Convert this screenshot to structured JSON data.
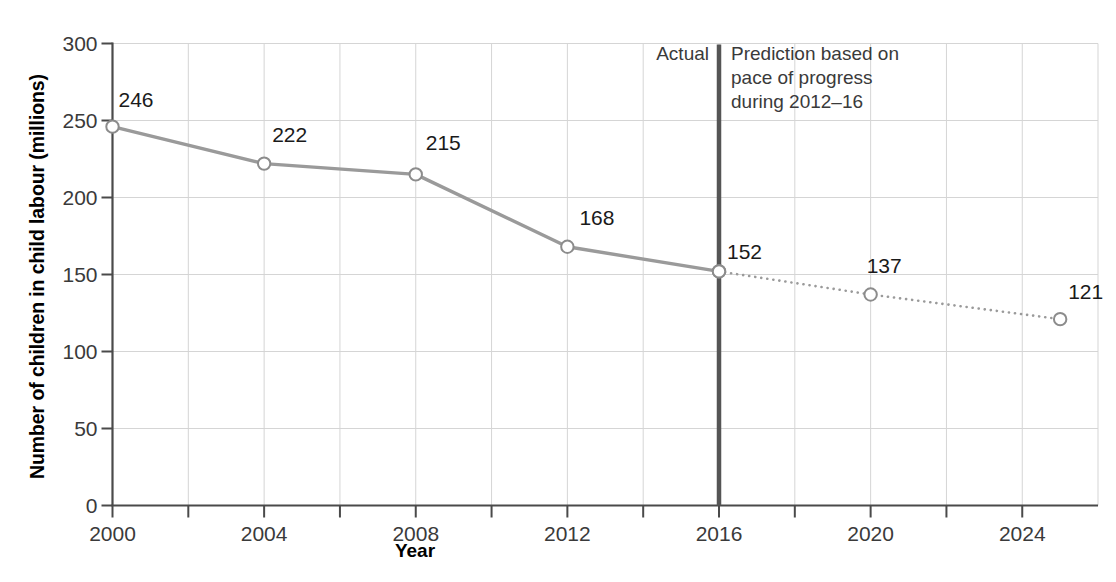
{
  "chart_data": {
    "type": "line",
    "title": "",
    "subtitle": "",
    "xlabel": "Year",
    "ylabel": "Number of children in child labour (millions)",
    "xlim": [
      1999,
      2026
    ],
    "ylim": [
      0,
      300
    ],
    "xticks": [
      2000,
      2004,
      2008,
      2012,
      2016,
      2020,
      2024
    ],
    "xtick_labels": [
      "2000",
      "2004",
      "2008",
      "2012",
      "2016",
      "2020",
      "2024"
    ],
    "xminor_step": 2,
    "yticks": [
      0,
      50,
      100,
      150,
      200,
      250,
      300
    ],
    "ytick_labels": [
      "0",
      "50",
      "100",
      "150",
      "200",
      "250",
      "300"
    ],
    "grid": true,
    "legend": "none",
    "series": [
      {
        "name": "Actual",
        "style": "solid",
        "color": "#9a9a9a",
        "x": [
          2000,
          2004,
          2008,
          2012,
          2016
        ],
        "values": [
          246,
          222,
          215,
          168,
          152
        ],
        "labels": [
          "246",
          "222",
          "215",
          "168",
          "152"
        ]
      },
      {
        "name": "Prediction based on pace of progress during 2012-16",
        "style": "dotted",
        "color": "#9a9a9a",
        "x": [
          2016,
          2020,
          2025
        ],
        "values": [
          152,
          137,
          121
        ],
        "labels": [
          "152",
          "137",
          "121"
        ]
      }
    ],
    "annotations": [
      {
        "name": "actual-label",
        "text": "Actual",
        "x": 2015.6,
        "y": 288
      },
      {
        "name": "prediction-label",
        "text": "Prediction based on\npace of progress\nduring 2012–16",
        "x": 2016.3,
        "y": 288
      }
    ],
    "divider": {
      "name": "actual-prediction-divider",
      "x": 2016,
      "color": "#555555"
    }
  },
  "axes": {
    "y_title": "Number of children in child labour (millions)",
    "x_title": "Year"
  },
  "colors": {
    "line": "#9a9a9a",
    "marker_fill": "#ffffff",
    "marker_stroke": "#8c8c8c",
    "grid": "#d5d5d5",
    "axis": "#4a4a4a",
    "divider": "#555555",
    "text": "#3a3a3a",
    "background": "#ffffff"
  }
}
